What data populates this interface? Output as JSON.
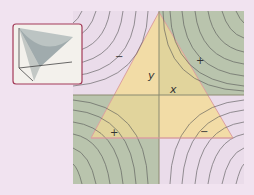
{
  "diagram": {
    "axes": {
      "x_label": "x",
      "y_label": "y"
    },
    "quadrant_signs": {
      "top_left": "−",
      "top_right": "+",
      "bottom_left": "+",
      "bottom_right": "−"
    },
    "colors": {
      "background": "#f1e3f0",
      "positive_region": "#b9c4ad",
      "negative_region": "#e8dbe8",
      "triangle_fill": "#f3dc9a",
      "triangle_edge": "#d9a0a0",
      "contour": "#555555",
      "inset_border": "#a33a58",
      "inset_bg": "#f3f1ec"
    },
    "inset": {
      "description": "saddle-surface"
    }
  }
}
